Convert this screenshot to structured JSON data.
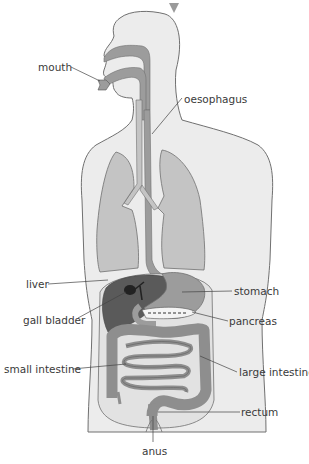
{
  "diagram": {
    "colors": {
      "background": "#ffffff",
      "body_fill": "#ececec",
      "body_outline": "#707070",
      "organ_fill": "#9c9c9c",
      "organ_light": "#c4c4c4",
      "liver_fill": "#5a5a5a",
      "gall_bladder_fill": "#222222",
      "label_text": "#3a3a3a",
      "leader_line": "#444444",
      "arrow": "#9a9a9a"
    },
    "top_marker": "down-arrow",
    "labels": {
      "mouth": "mouth",
      "oesophagus": "oesophagus",
      "liver": "liver",
      "stomach": "stomach",
      "gall_bladder": "gall bladder",
      "pancreas": "pancreas",
      "small_intestine": "small intestine",
      "large_intestine": "large intestine",
      "rectum": "rectum",
      "anus": "anus"
    }
  }
}
